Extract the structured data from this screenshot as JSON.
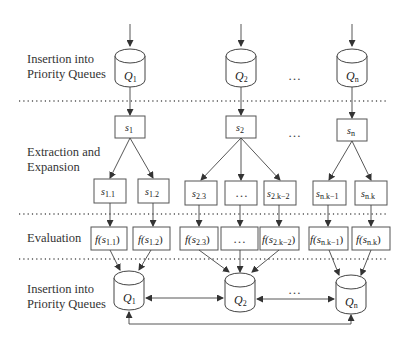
{
  "stages": {
    "insertion_top": [
      "Insertion into",
      "Priority Queues"
    ],
    "extraction": [
      "Extraction and",
      "Expansion"
    ],
    "evaluation": [
      "Evaluation"
    ],
    "insertion_bottom": [
      "Insertion into",
      "Priority Queues"
    ]
  },
  "queues_top": [
    {
      "base": "Q",
      "sub": "1"
    },
    {
      "base": "Q",
      "sub": "2"
    },
    {
      "base": "Q",
      "sub": "n"
    }
  ],
  "extracted": [
    {
      "base": "s",
      "sub": "1"
    },
    {
      "base": "s",
      "sub": "2"
    },
    {
      "base": "s",
      "sub": "n"
    }
  ],
  "expanded": [
    {
      "base": "s",
      "sub": "1.1"
    },
    {
      "base": "s",
      "sub": "1.2"
    },
    {
      "base": "s",
      "sub": "2.3"
    },
    {
      "base": "",
      "sub": "",
      "text": "…"
    },
    {
      "base": "s",
      "sub": "2.k−2"
    },
    {
      "base": "s",
      "sub": "n.k−1"
    },
    {
      "base": "s",
      "sub": "n.k"
    }
  ],
  "evaluated": [
    {
      "pre": "f(",
      "base": "s",
      "sub": "1.1",
      "post": ")"
    },
    {
      "pre": "f(",
      "base": "s",
      "sub": "1.2",
      "post": ")"
    },
    {
      "pre": "f(",
      "base": "s",
      "sub": "2.3",
      "post": ")"
    },
    {
      "pre": "",
      "base": "",
      "sub": "",
      "post": "",
      "text": "…"
    },
    {
      "pre": "f(",
      "base": "s",
      "sub": "2.k−2",
      "post": ")"
    },
    {
      "pre": "f(",
      "base": "s",
      "sub": "n.k−1",
      "post": ")"
    },
    {
      "pre": "f(",
      "base": "s",
      "sub": "n.k",
      "post": ")"
    }
  ],
  "queues_bottom": [
    {
      "base": "Q",
      "sub": "1"
    },
    {
      "base": "Q",
      "sub": "2"
    },
    {
      "base": "Q",
      "sub": "n"
    }
  ],
  "ellipsis": "…"
}
